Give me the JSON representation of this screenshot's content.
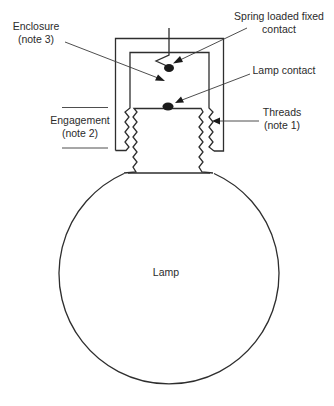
{
  "diagram": {
    "type": "cross-section schematic",
    "labels": {
      "enclosure_line1": "Enclosure",
      "enclosure_line2": "(note 3)",
      "spring_line1": "Spring loaded fixed",
      "spring_line2": "contact",
      "lamp_contact": "Lamp contact",
      "threads_line1": "Threads",
      "threads_line2": "(note 1)",
      "engagement_line1": "Engagement",
      "engagement_line2": "(note 2)",
      "lamp": "Lamp"
    },
    "colors": {
      "line": "#2e2e2e",
      "text": "#2b2b2b",
      "background": "#ffffff"
    }
  }
}
